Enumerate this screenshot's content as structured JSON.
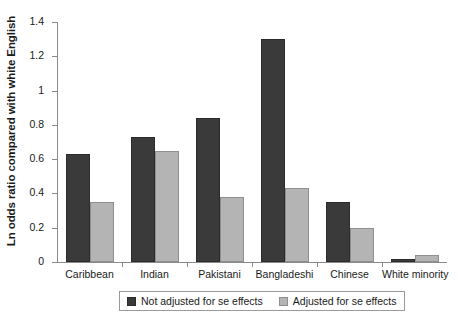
{
  "chart_data": {
    "type": "bar",
    "title": "",
    "xlabel": "",
    "ylabel": "Ln odds ratio compared with white English",
    "ylim": [
      0,
      1.4
    ],
    "yticks": [
      "0",
      "0.2",
      "0.4",
      "0.6",
      "0.8",
      "1",
      "1.2",
      "1.4"
    ],
    "ytick_values": [
      0,
      0.2,
      0.4,
      0.6,
      0.8,
      1.0,
      1.2,
      1.4
    ],
    "grid": false,
    "legend_position": "bottom",
    "categories": [
      "Caribbean",
      "Indian",
      "Pakistani",
      "Bangladeshi",
      "Chinese",
      "White minority"
    ],
    "series": [
      {
        "name": "Not adjusted for se effects",
        "color": "#3a3a3a",
        "values": [
          0.63,
          0.73,
          0.84,
          1.3,
          0.35,
          0.02
        ]
      },
      {
        "name": "Adjusted for se effects",
        "color": "#b4b4b4",
        "values": [
          0.35,
          0.65,
          0.38,
          0.43,
          0.2,
          0.04
        ]
      }
    ]
  },
  "legend": {
    "items": [
      {
        "label": "Not adjusted for se effects",
        "swatch": "dark-swatch-icon"
      },
      {
        "label": "Adjusted for se effects",
        "swatch": "light-swatch-icon"
      }
    ]
  }
}
